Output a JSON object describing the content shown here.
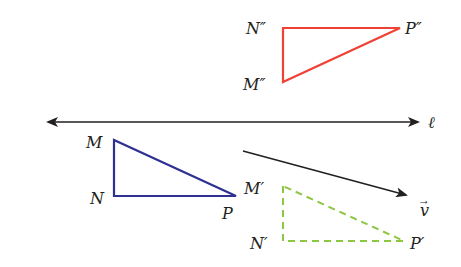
{
  "diagram": {
    "colors": {
      "line": "#231f20",
      "original_triangle": "#2e3192",
      "translated_triangle": "#8dc63f",
      "reflected_triangle": "#ef4136"
    },
    "line_l": {
      "label": "ℓ",
      "x1": 46,
      "y1": 122,
      "x2": 420,
      "y2": 122,
      "bidirectional": true
    },
    "vector_v": {
      "label": "v",
      "arrow_accent": "→",
      "x1": 243,
      "y1": 151,
      "x2": 408,
      "y2": 196
    },
    "triangle_MNP": {
      "style": "solid",
      "vertices": {
        "M": {
          "label": "M",
          "x": 114,
          "y": 140
        },
        "N": {
          "label": "N",
          "x": 114,
          "y": 196
        },
        "P": {
          "label": "P",
          "x": 236,
          "y": 196
        }
      }
    },
    "triangle_MNP_prime": {
      "style": "dashed",
      "vertices": {
        "M": {
          "label": "M′",
          "x": 283,
          "y": 186
        },
        "N": {
          "label": "N′",
          "x": 283,
          "y": 241
        },
        "P": {
          "label": "P′",
          "x": 404,
          "y": 241
        }
      }
    },
    "triangle_MNP_double_prime": {
      "style": "solid",
      "vertices": {
        "M": {
          "label": "M″",
          "x": 283,
          "y": 82
        },
        "N": {
          "label": "N″",
          "x": 283,
          "y": 28
        },
        "P": {
          "label": "P″",
          "x": 400,
          "y": 28
        }
      }
    }
  }
}
